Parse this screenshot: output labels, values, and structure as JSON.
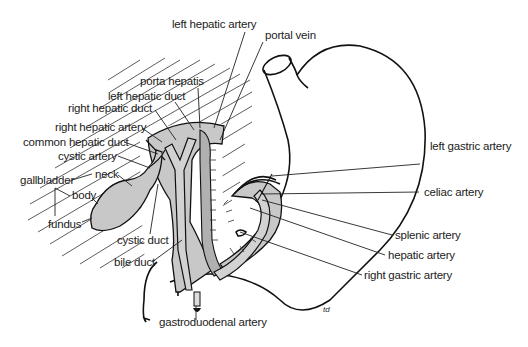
{
  "diagram": {
    "signature": "td",
    "labels": {
      "left_hepatic_artery": "left hepatic artery",
      "portal_vein": "portal vein",
      "porta_hepatis": "porta hepatis",
      "left_hepatic_duct": "left hepatic duct",
      "right_hepatic_duct": "right hepatic duct",
      "right_hepatic_artery": "right hepatic artery",
      "common_hepatic_duct": "common hepatic duct",
      "cystic_artery": "cystic artery",
      "neck": "neck",
      "gallbladder": "gallbladder",
      "body": "body",
      "fundus": "fundus",
      "cystic_duct": "cystic duct",
      "bile_duct": "bile duct",
      "gastroduodenal_artery": "gastroduodenal artery",
      "left_gastric_artery": "left gastric artery",
      "celiac_artery": "celiac artery",
      "splenic_artery": "splenic artery",
      "hepatic_artery": "hepatic artery",
      "right_gastric_artery": "right gastric artery"
    }
  }
}
